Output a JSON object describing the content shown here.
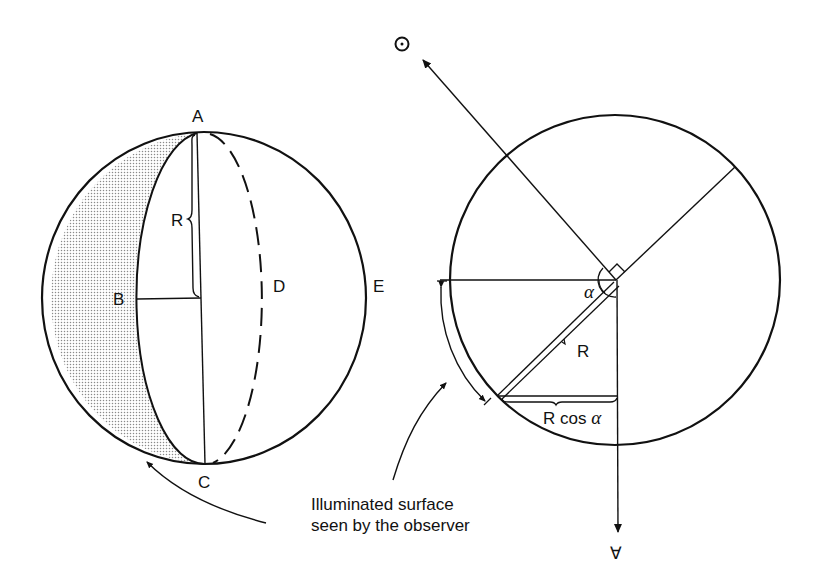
{
  "diagram": {
    "left_sphere": {
      "labels": {
        "A": "A",
        "B": "B",
        "C": "C",
        "D": "D",
        "E": "E",
        "R": "R"
      },
      "shaded_region": "dark-crescent"
    },
    "right_circle": {
      "labels": {
        "sun": "⊙",
        "alpha": "α",
        "R": "R",
        "R_cos_alpha_R": "R cos ",
        "R_cos_alpha_alpha": "α",
        "observer": "∀"
      }
    },
    "caption": {
      "line1": "Illuminated surface",
      "line2": "seen by the observer"
    },
    "colors": {
      "ink": "#111111",
      "background": "#ffffff",
      "shading": "#9a9a9a"
    }
  }
}
